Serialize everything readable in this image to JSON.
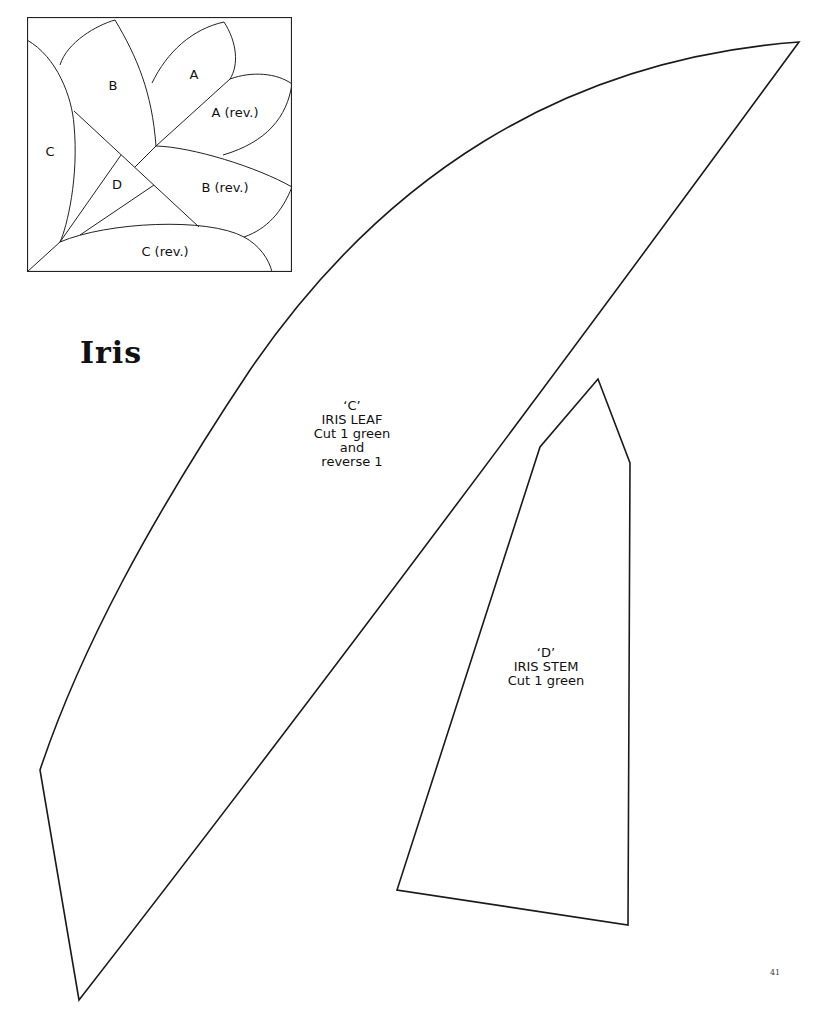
{
  "diagram": {
    "labels": {
      "a": "A",
      "a_rev": "A (rev.)",
      "b": "B",
      "b_rev": "B (rev.)",
      "c": "C",
      "c_rev": "C (rev.)",
      "d": "D"
    }
  },
  "title": "Iris",
  "pieces": [
    {
      "code": "‘C’",
      "name": "IRIS LEAF",
      "line1": "Cut 1 green",
      "line2": "and",
      "line3": "reverse 1"
    },
    {
      "code": "‘D’",
      "name": "IRIS STEM",
      "line1": "Cut 1 green"
    }
  ],
  "page_number": "41",
  "colors": {
    "line": "#1a1a1a",
    "background": "#ffffff"
  }
}
